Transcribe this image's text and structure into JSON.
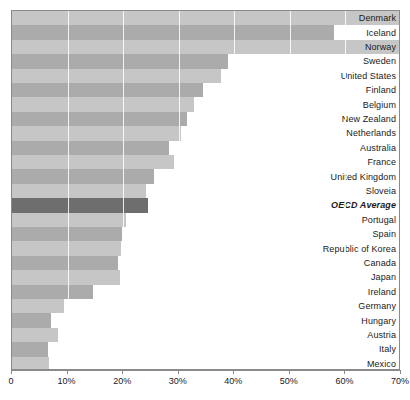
{
  "chart_data": {
    "type": "bar",
    "orientation": "horizontal",
    "title": "",
    "xlabel": "",
    "ylabel": "",
    "xlim": [
      0,
      70
    ],
    "xtick_labels": [
      "0",
      "10%",
      "20%",
      "30%",
      "40%",
      "50%",
      "60%",
      "70%"
    ],
    "xtick_values": [
      0,
      10,
      20,
      30,
      40,
      50,
      60,
      70
    ],
    "grid": true,
    "legend": false,
    "value_unit": "%",
    "highlight_category": "OECD Average",
    "categories": [
      "Denmark",
      "Iceland",
      "Norway",
      "Sweden",
      "United States",
      "Finland",
      "Belgium",
      "New Zealand",
      "Netherlands",
      "Australia",
      "France",
      "United Kingdom",
      "Sloveia",
      "OECD Average",
      "Portugal",
      "Spain",
      "Republic of Korea",
      "Canada",
      "Japan",
      "Ireland",
      "Germany",
      "Hungary",
      "Austria",
      "Italy",
      "Mexico"
    ],
    "values": [
      70.0,
      58.0,
      70.0,
      38.9,
      37.6,
      34.4,
      32.8,
      31.5,
      30.4,
      28.3,
      29.2,
      25.6,
      24.1,
      24.5,
      20.5,
      19.8,
      19.6,
      19.1,
      19.4,
      14.6,
      9.4,
      7.0,
      8.3,
      6.5,
      6.7
    ]
  },
  "colors": {
    "stripe_light": "#c6c6c6",
    "stripe_dark": "#ababab",
    "highlight_bar": "#6e6e6e",
    "plot_background": "#ffffff",
    "border": "#8a8a8a",
    "text": "#1a1a1a"
  }
}
